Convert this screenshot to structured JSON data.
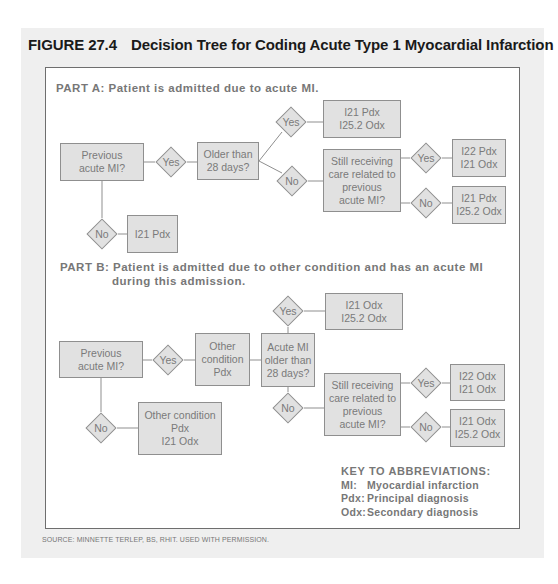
{
  "figure": {
    "number": "FIGURE 27.4",
    "title": "Decision Tree for Coding Acute Type 1 Myocardial Infarction"
  },
  "part_a": {
    "label": "PART A: Patient is admitted due to acute MI.",
    "nodes": {
      "previous_mi": [
        "Previous",
        "acute MI?"
      ],
      "yes1": "Yes",
      "no1": "No",
      "i21_pdx": [
        "I21 Pdx"
      ],
      "older_28": [
        "Older than",
        "28 days?"
      ],
      "yes2": "Yes",
      "no2": "No",
      "result_yes2": [
        "I21 Pdx",
        "I25.2 Odx"
      ],
      "still_receiving": [
        "Still receiving",
        "care related to",
        "previous",
        "acute MI?"
      ],
      "yes3": "Yes",
      "no3": "No",
      "result_yes3": [
        "I22 Pdx",
        "I21 Odx"
      ],
      "result_no3": [
        "I21 Pdx",
        "I25.2 Odx"
      ]
    }
  },
  "part_b": {
    "label_line1": "PART B: Patient is admitted due to other condition and has an acute MI",
    "label_line2": "during this admission.",
    "nodes": {
      "previous_mi": [
        "Previous",
        "acute MI?"
      ],
      "yes1": "Yes",
      "no1": "No",
      "other_pdx": [
        "Other",
        "condition",
        "Pdx"
      ],
      "no_result": [
        "Other condition",
        "Pdx",
        "I21 Odx"
      ],
      "acute_older": [
        "Acute MI",
        "older than",
        "28 days?"
      ],
      "yes2": "Yes",
      "no2": "No",
      "result_yes2": [
        "I21 Odx",
        "I25.2 Odx"
      ],
      "still_receiving": [
        "Still receiving",
        "care related to",
        "previous",
        "acute MI?"
      ],
      "yes3": "Yes",
      "no3": "No",
      "result_yes3": [
        "I22 Odx",
        "I21 Odx"
      ],
      "result_no3": [
        "I21 Odx",
        "I25.2 Odx"
      ]
    }
  },
  "key": {
    "header": "KEY TO ABBREVIATIONS:",
    "items": [
      {
        "abbr": "MI:",
        "meaning": "Myocardial infarction"
      },
      {
        "abbr": "Pdx:",
        "meaning": "Principal diagnosis"
      },
      {
        "abbr": "Odx:",
        "meaning": "Secondary diagnosis"
      }
    ]
  },
  "source": "SOURCE: MINNETTE TERLEP, BS, RHIT. USED WITH PERMISSION.",
  "colors": {
    "panel_bg": "#efefef",
    "node_fill": "#e1e1e1",
    "node_border": "#8f8f8f",
    "node_text": "#7a7a7a",
    "title_text": "#1a1a1a"
  }
}
